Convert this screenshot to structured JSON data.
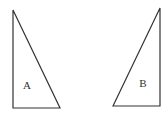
{
  "diagram": {
    "type": "two-right-triangles",
    "stroke_color": "#333333",
    "background": "#ffffff",
    "triangles": [
      {
        "label": "A",
        "points": "13,10 13,108 60,108",
        "label_pos": [
          27,
          89
        ]
      },
      {
        "label": "B",
        "points": "113,106 160,8 160,106",
        "label_pos": [
          143,
          87
        ]
      }
    ]
  }
}
